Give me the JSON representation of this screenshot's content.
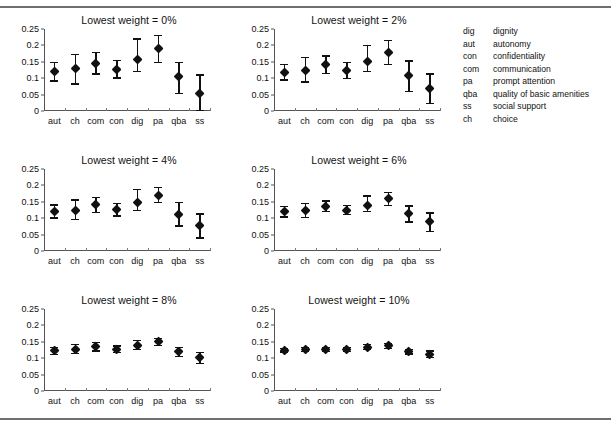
{
  "figure": {
    "title": "",
    "panel_title_prefix": "Lowest weight = "
  },
  "legend": {
    "items": [
      {
        "abbr": "dig",
        "definition": "dignity"
      },
      {
        "abbr": "aut",
        "definition": "autonomy"
      },
      {
        "abbr": "con",
        "definition": "confidentiality"
      },
      {
        "abbr": "com",
        "definition": "communication"
      },
      {
        "abbr": "pa",
        "definition": "prompt attention"
      },
      {
        "abbr": "qba",
        "definition": "quality of basic amenities"
      },
      {
        "abbr": "ss",
        "definition": "social support"
      },
      {
        "abbr": "ch",
        "definition": "choice"
      }
    ]
  },
  "chart_data": [
    {
      "type": "scatter",
      "title": "Lowest weight = 0%",
      "xlabel": "",
      "ylabel": "",
      "ylim": [
        0,
        0.25
      ],
      "yticks": [
        0.25,
        0.2,
        0.15,
        0.1,
        0.05,
        0
      ],
      "ytick_labels": [
        "0.25",
        "0.2",
        "0.15",
        "0.1",
        "0.05",
        "0"
      ],
      "grid": false,
      "categories": [
        "aut",
        "ch",
        "com",
        "con",
        "dig",
        "pa",
        "qba",
        "ss"
      ],
      "values": [
        0.12,
        0.128,
        0.145,
        0.127,
        0.156,
        0.19,
        0.106,
        0.053
      ],
      "err_low": [
        0.092,
        0.082,
        0.113,
        0.101,
        0.12,
        0.148,
        0.053,
        0.001
      ],
      "err_high": [
        0.147,
        0.172,
        0.178,
        0.154,
        0.22,
        0.23,
        0.148,
        0.11
      ]
    },
    {
      "type": "scatter",
      "title": "Lowest weight = 2%",
      "xlabel": "",
      "ylabel": "",
      "ylim": [
        0,
        0.25
      ],
      "yticks": [
        0.25,
        0.2,
        0.15,
        0.1,
        0.05,
        0
      ],
      "ytick_labels": [
        "0.25",
        "0.2",
        "0.15",
        "0.1",
        "0.05",
        "0"
      ],
      "grid": false,
      "categories": [
        "aut",
        "ch",
        "com",
        "con",
        "dig",
        "pa",
        "qba",
        "ss"
      ],
      "values": [
        0.118,
        0.124,
        0.142,
        0.124,
        0.15,
        0.179,
        0.107,
        0.067
      ],
      "err_low": [
        0.094,
        0.088,
        0.115,
        0.1,
        0.121,
        0.142,
        0.06,
        0.022
      ],
      "err_high": [
        0.142,
        0.163,
        0.168,
        0.148,
        0.2,
        0.215,
        0.152,
        0.113
      ]
    },
    {
      "type": "scatter",
      "title": "Lowest weight = 4%",
      "xlabel": "",
      "ylabel": "",
      "ylim": [
        0,
        0.25
      ],
      "yticks": [
        0.25,
        0.2,
        0.15,
        0.1,
        0.05,
        0
      ],
      "ytick_labels": [
        "0.25",
        "0.2",
        "0.15",
        "0.1",
        "0.05",
        "0"
      ],
      "grid": false,
      "categories": [
        "aut",
        "ch",
        "com",
        "con",
        "dig",
        "pa",
        "qba",
        "ss"
      ],
      "values": [
        0.12,
        0.124,
        0.141,
        0.126,
        0.149,
        0.17,
        0.111,
        0.078
      ],
      "err_low": [
        0.101,
        0.097,
        0.118,
        0.107,
        0.124,
        0.147,
        0.076,
        0.04
      ],
      "err_high": [
        0.14,
        0.155,
        0.163,
        0.145,
        0.188,
        0.194,
        0.147,
        0.113
      ]
    },
    {
      "type": "scatter",
      "title": "Lowest weight = 6%",
      "xlabel": "",
      "ylabel": "",
      "ylim": [
        0,
        0.25
      ],
      "yticks": [
        0.25,
        0.2,
        0.15,
        0.1,
        0.05,
        0
      ],
      "ytick_labels": [
        "0.25",
        "0.2",
        "0.15",
        "0.1",
        "0.05",
        "0"
      ],
      "grid": false,
      "categories": [
        "aut",
        "ch",
        "com",
        "con",
        "dig",
        "pa",
        "qba",
        "ss"
      ],
      "values": [
        0.119,
        0.122,
        0.136,
        0.124,
        0.14,
        0.16,
        0.114,
        0.089
      ],
      "err_low": [
        0.104,
        0.103,
        0.12,
        0.111,
        0.121,
        0.138,
        0.089,
        0.06
      ],
      "err_high": [
        0.136,
        0.145,
        0.152,
        0.139,
        0.168,
        0.178,
        0.137,
        0.116
      ]
    },
    {
      "type": "scatter",
      "title": "Lowest weight = 8%",
      "xlabel": "",
      "ylabel": "",
      "ylim": [
        0,
        0.25
      ],
      "yticks": [
        0.25,
        0.2,
        0.15,
        0.1,
        0.05,
        0
      ],
      "ytick_labels": [
        "0.25",
        "0.2",
        "0.15",
        "0.1",
        "0.05",
        "0"
      ],
      "grid": false,
      "categories": [
        "aut",
        "ch",
        "com",
        "con",
        "dig",
        "pa",
        "qba",
        "ss"
      ],
      "values": [
        0.122,
        0.127,
        0.134,
        0.127,
        0.139,
        0.15,
        0.119,
        0.101
      ],
      "err_low": [
        0.112,
        0.114,
        0.122,
        0.117,
        0.126,
        0.139,
        0.105,
        0.083
      ],
      "err_high": [
        0.132,
        0.141,
        0.147,
        0.137,
        0.154,
        0.161,
        0.132,
        0.118
      ]
    },
    {
      "type": "scatter",
      "title": "Lowest weight = 10%",
      "xlabel": "",
      "ylabel": "",
      "ylim": [
        0,
        0.25
      ],
      "yticks": [
        0.25,
        0.2,
        0.15,
        0.1,
        0.05,
        0
      ],
      "ytick_labels": [
        "0.25",
        "0.2",
        "0.15",
        "0.1",
        "0.05",
        "0"
      ],
      "grid": false,
      "categories": [
        "aut",
        "ch",
        "com",
        "con",
        "dig",
        "pa",
        "qba",
        "ss"
      ],
      "values": [
        0.124,
        0.126,
        0.126,
        0.126,
        0.133,
        0.137,
        0.12,
        0.112
      ],
      "err_low": [
        0.119,
        0.12,
        0.121,
        0.121,
        0.126,
        0.13,
        0.113,
        0.103
      ],
      "err_high": [
        0.13,
        0.133,
        0.132,
        0.132,
        0.142,
        0.145,
        0.127,
        0.122
      ]
    }
  ]
}
